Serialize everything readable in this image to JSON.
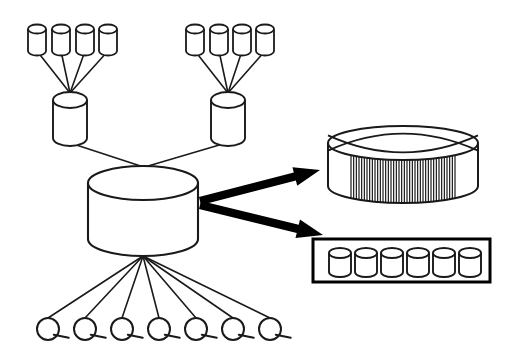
{
  "diagram": {
    "background_color": "#ffffff",
    "line_color": "#1a1a1a",
    "arrow_color": "#000000",
    "canvas": {
      "width": 508,
      "height": 363
    },
    "groups": {
      "top_left_sources": {
        "name": "top-left-source-cylinders",
        "count": 4,
        "cylinders": [
          {
            "cx": 37,
            "cy": 29,
            "rx": 9,
            "ry": 4.5,
            "h": 22
          },
          {
            "cx": 61,
            "cy": 29,
            "rx": 9,
            "ry": 4.5,
            "h": 22
          },
          {
            "cx": 85,
            "cy": 29,
            "rx": 9,
            "ry": 4.5,
            "h": 22
          },
          {
            "cx": 108,
            "cy": 29,
            "rx": 9,
            "ry": 4.5,
            "h": 22
          }
        ]
      },
      "top_right_sources": {
        "name": "top-right-source-cylinders",
        "count": 4,
        "cylinders": [
          {
            "cx": 195,
            "cy": 29,
            "rx": 9,
            "ry": 4.5,
            "h": 22
          },
          {
            "cx": 219,
            "cy": 29,
            "rx": 9,
            "ry": 4.5,
            "h": 22
          },
          {
            "cx": 242,
            "cy": 29,
            "rx": 9,
            "ry": 4.5,
            "h": 22
          },
          {
            "cx": 265,
            "cy": 29,
            "rx": 9,
            "ry": 4.5,
            "h": 22
          }
        ]
      }
    },
    "mid_nodes": [
      {
        "name": "mid-cylinder-left",
        "cx": 70,
        "cy": 100,
        "rx": 17,
        "ry": 8,
        "h": 38
      },
      {
        "name": "mid-cylinder-right",
        "cx": 228,
        "cy": 100,
        "rx": 17,
        "ry": 8,
        "h": 38
      }
    ],
    "center_node": {
      "name": "central-warehouse-cylinder",
      "cx": 143,
      "cy": 183,
      "rx": 55,
      "ry": 17,
      "h": 56
    },
    "leaf_nodes": {
      "name": "query-client-nodes",
      "count": 7,
      "radius": 11,
      "cy": 329,
      "positions": [
        48,
        85,
        122,
        159,
        196,
        233,
        270
      ],
      "tail_length": 13
    },
    "output_disk": {
      "name": "striped-cube-disk",
      "cx": 403,
      "cy_top": 143,
      "rx": 75,
      "ry": 17,
      "h": 43,
      "stripe_count": 40,
      "stripe_inset": 23,
      "has_cross_on_top": true
    },
    "output_box": {
      "name": "cylinder-array-box",
      "x": 313,
      "y": 239,
      "width": 177,
      "height": 43,
      "cylinder_count": 6,
      "cylinders": [
        {
          "cx": 340,
          "cy": 253,
          "rx": 11,
          "ry": 5,
          "h": 19
        },
        {
          "cx": 366,
          "cy": 253,
          "rx": 11,
          "ry": 5,
          "h": 19
        },
        {
          "cx": 392,
          "cy": 253,
          "rx": 11,
          "ry": 5,
          "h": 19
        },
        {
          "cx": 418,
          "cy": 253,
          "rx": 11,
          "ry": 5,
          "h": 19
        },
        {
          "cx": 444,
          "cy": 253,
          "rx": 11,
          "ry": 5,
          "h": 19
        },
        {
          "cx": 470,
          "cy": 253,
          "rx": 11,
          "ry": 5,
          "h": 19
        }
      ]
    },
    "arrows": [
      {
        "name": "arrow-to-striped-disk",
        "x1": 200,
        "y1": 201,
        "x2": 320,
        "y2": 170
      },
      {
        "name": "arrow-to-cylinder-box",
        "x1": 200,
        "y1": 205,
        "x2": 323,
        "y2": 235
      }
    ]
  }
}
